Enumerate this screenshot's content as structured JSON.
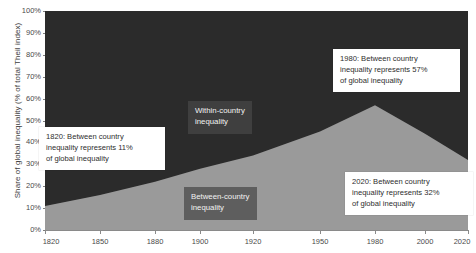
{
  "chart_data": {
    "type": "area",
    "stacked": true,
    "title": "",
    "xlabel": "",
    "ylabel": "Share of global inequality (% of total Theil index)",
    "ylim": [
      0,
      100
    ],
    "y_ticks": [
      "0%",
      "10%",
      "20%",
      "30%",
      "40%",
      "50%",
      "60%",
      "70%",
      "80%",
      "90%",
      "100%"
    ],
    "y_tick_values": [
      0,
      10,
      20,
      30,
      40,
      50,
      60,
      70,
      80,
      90,
      100
    ],
    "x_ticks": [
      "1820",
      "1850",
      "1880",
      "1900",
      "1920",
      "1950",
      "1980",
      "2000",
      "2020"
    ],
    "x_tick_values": [
      1820,
      1850,
      1880,
      1900,
      1920,
      1950,
      1980,
      2000,
      2020
    ],
    "x_tick_positions_px": [
      0,
      55,
      110,
      155,
      208,
      275,
      330,
      380,
      423
    ],
    "grid": false,
    "legend": "in-chart labels",
    "categories": [
      1820,
      1850,
      1880,
      1900,
      1920,
      1950,
      1980,
      2000,
      2020
    ],
    "series": [
      {
        "name": "Between-country inequality",
        "color": "#9a9a9a",
        "values": [
          11,
          16,
          22,
          28,
          34,
          45,
          57,
          44,
          32
        ]
      },
      {
        "name": "Within-country inequality",
        "color": "#2b2b2b",
        "values": [
          89,
          84,
          78,
          72,
          66,
          55,
          43,
          56,
          68
        ]
      }
    ],
    "annotations": [
      {
        "name": "1820-callout",
        "year": 1820,
        "value": 11,
        "text": "1820: Between country\ninequality represents 11%\nof global inequality"
      },
      {
        "name": "1980-callout",
        "year": 1980,
        "value": 57,
        "text": "1980: Between country\ninequality represents 57%\nof global inequality"
      },
      {
        "name": "2020-callout",
        "year": 2020,
        "value": 32,
        "text": "2020: Between country\ninequality represents 32%\nof global inequality"
      }
    ],
    "region_labels": [
      {
        "name": "within-country",
        "text": "Within-country\ninequality"
      },
      {
        "name": "between-country",
        "text": "Between-country\ninequality"
      }
    ]
  },
  "colors": {
    "within_country_area": "#2b2b2b",
    "between_country_area": "#9a9a9a",
    "axis": "#8a8a8a",
    "tick_text": "#4a4a4a",
    "callout_bg": "#ffffff",
    "region_label_bg": "rgba(70,70,70,0.72)",
    "page_bg": "#ffffff"
  }
}
